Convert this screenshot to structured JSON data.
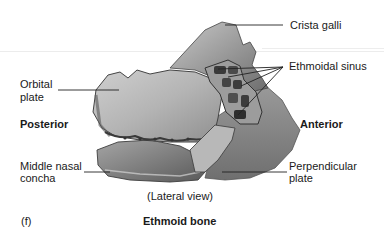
{
  "figure": {
    "panel_letter": "(f)",
    "title": "Ethmoid bone",
    "view": "(Lateral view)"
  },
  "orientation": {
    "left": "Posterior",
    "right": "Anterior"
  },
  "labels": {
    "crista_galli": "Crista galli",
    "ethmoidal_sinus": "Ethmoidal sinus",
    "orbital_plate_line1": "Orbital",
    "orbital_plate_line2": "plate",
    "middle_nasal_concha_line1": "Middle nasal",
    "middle_nasal_concha_line2": "concha",
    "perpendicular_plate_line1": "Perpendicular",
    "perpendicular_plate_line2": "plate"
  },
  "colors": {
    "background": "#ffffff",
    "text": "#1a1a1a",
    "bone_light": "#b9b9b9",
    "bone_mid": "#8c8c8c",
    "bone_dark": "#3d3d3d",
    "leader_line": "#222222"
  }
}
